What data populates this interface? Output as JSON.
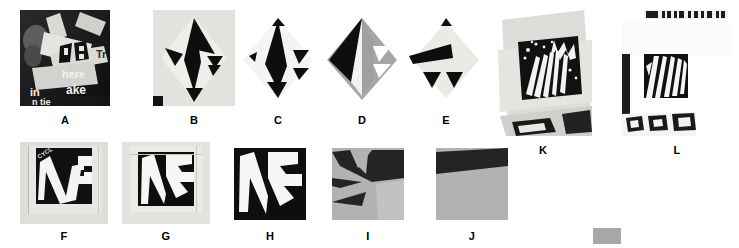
{
  "figure": {
    "background_color": "#ffffff",
    "panel_count": 12,
    "colors": {
      "black": "#111111",
      "white": "#ffffff",
      "gray": "#a8a8a8",
      "light_gray": "#e8e8e4",
      "paper": "#dcdcd8",
      "dark_photo": "#1a1a1a"
    }
  },
  "panels": [
    {
      "id": "A",
      "label": "A",
      "kind": "photograph",
      "content": "Photograph of overlapping paper strips with printed text over a dark background",
      "visible_text": [
        "here",
        "ake",
        "in",
        "Tr"
      ],
      "x": 20,
      "y": 10,
      "w": 90,
      "h": 96,
      "label_x": 20,
      "label_y": 114,
      "label_w": 90
    },
    {
      "id": "B",
      "label": "B",
      "kind": "abstraction",
      "content": "Light square with a black diamond-and-arrow cut-out figure",
      "visible_text": [],
      "x": 153,
      "y": 10,
      "w": 82,
      "h": 96,
      "label_x": 153,
      "label_y": 114,
      "label_w": 82
    },
    {
      "id": "C",
      "label": "C",
      "kind": "abstraction",
      "content": "White diamond with black triangular wedges forming an arrow motif",
      "visible_text": [],
      "x": 237,
      "y": 10,
      "w": 82,
      "h": 96,
      "label_x": 237,
      "label_y": 114,
      "label_w": 82
    },
    {
      "id": "D",
      "label": "D",
      "kind": "abstraction",
      "content": "Diamond split into black, white and mid-gray regions",
      "visible_text": [],
      "x": 321,
      "y": 10,
      "w": 82,
      "h": 96,
      "label_x": 321,
      "label_y": 114,
      "label_w": 82
    },
    {
      "id": "E",
      "label": "E",
      "kind": "abstraction",
      "content": "Light diamond with a black wedge band and two black triangles",
      "visible_text": [],
      "x": 405,
      "y": 10,
      "w": 82,
      "h": 96,
      "label_x": 405,
      "label_y": 114,
      "label_w": 82
    },
    {
      "id": "F",
      "label": "F",
      "kind": "photograph",
      "content": "Photograph of a black square poster with large white letterforms on textured paper",
      "visible_text": [
        "CYCL"
      ],
      "x": 20,
      "y": 142,
      "w": 88,
      "h": 82,
      "label_x": 20,
      "label_y": 230,
      "label_w": 88
    },
    {
      "id": "G",
      "label": "G",
      "kind": "abstraction",
      "content": "Black and white abstraction of the letterform poster on light paper",
      "visible_text": [],
      "x": 122,
      "y": 142,
      "w": 88,
      "h": 82,
      "label_x": 122,
      "label_y": 230,
      "label_w": 88
    },
    {
      "id": "H",
      "label": "H",
      "kind": "abstraction",
      "content": "Pure black-and-white abstraction of the letterform shapes",
      "visible_text": [],
      "x": 234,
      "y": 148,
      "w": 72,
      "h": 72,
      "label_x": 234,
      "label_y": 230,
      "label_w": 72
    },
    {
      "id": "I",
      "label": "I",
      "kind": "abstraction",
      "content": "Gray and black simplified shape abstraction",
      "visible_text": [],
      "x": 332,
      "y": 148,
      "w": 72,
      "h": 72,
      "label_x": 332,
      "label_y": 230,
      "label_w": 72
    },
    {
      "id": "J",
      "label": "J",
      "kind": "abstraction",
      "content": "Gray field with a single black diagonal corner wedge",
      "visible_text": [],
      "x": 436,
      "y": 148,
      "w": 72,
      "h": 72,
      "label_x": 436,
      "label_y": 230,
      "label_w": 72
    },
    {
      "id": "K",
      "label": "K",
      "kind": "photograph",
      "content": "Tilted light square containing an inset photograph of a dark flame or grass texture",
      "visible_text": [],
      "x": 492,
      "y": 6,
      "w": 102,
      "h": 130,
      "label_x": 492,
      "label_y": 144,
      "label_w": 102
    },
    {
      "id": "L",
      "label": "L",
      "kind": "photograph",
      "content": "White panel with an inset square of bold black zebra-like stripes and a printed strip at top",
      "visible_text": [],
      "x": 622,
      "y": 6,
      "w": 110,
      "h": 130,
      "label_x": 622,
      "label_y": 144,
      "label_w": 110
    }
  ],
  "swatch": {
    "name": "gray-swatch",
    "color": "#a8a8a8",
    "x": 593,
    "y": 228,
    "w": 28,
    "h": 16
  }
}
